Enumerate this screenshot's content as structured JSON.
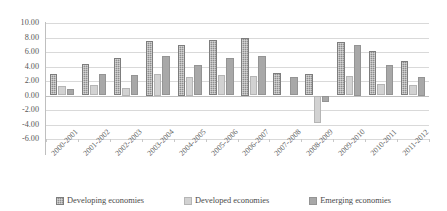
{
  "chart_data": {
    "type": "bar",
    "title": "",
    "subtitle": "",
    "xlabel": "",
    "ylabel": "",
    "ylim": [
      -6.0,
      10.0
    ],
    "ytick_step": 2.0,
    "yticks": [
      "10.00",
      "8.00",
      "6.00",
      "4.00",
      "2.00",
      "0.00",
      "-2.00",
      "-4.00",
      "-6.00"
    ],
    "ytick_values": [
      10.0,
      8.0,
      6.0,
      4.0,
      2.0,
      0.0,
      -2.0,
      -4.0,
      -6.0
    ],
    "grid": true,
    "legend_position": "bottom",
    "categories": [
      "2000-2001",
      "2001-2002",
      "2002-2003",
      "2003-2004",
      "2004-2005",
      "2005-2006",
      "2006-2007",
      "2007-2008",
      "2008-2009",
      "2009-2010",
      "2010-2011",
      "2011-2012"
    ],
    "series": [
      {
        "name": "Developing economies",
        "color": "#8f8f8f",
        "values": [
          2.9,
          4.4,
          5.2,
          7.5,
          7.0,
          7.7,
          8.0,
          3.1,
          2.9,
          7.4,
          6.2,
          4.7
        ]
      },
      {
        "name": "Developed economies",
        "color": "#d2d2d2",
        "values": [
          1.3,
          1.4,
          1.0,
          3.0,
          2.5,
          2.8,
          2.7,
          0.0,
          -3.8,
          2.7,
          1.6,
          1.4
        ]
      },
      {
        "name": "Emerging economies",
        "color": "#a8a8a8",
        "values": [
          0.9,
          2.9,
          2.8,
          5.4,
          4.2,
          5.2,
          5.4,
          2.6,
          -0.9,
          7.0,
          4.2,
          2.5
        ]
      }
    ]
  },
  "legend": {
    "items": [
      {
        "label": "Developing economies",
        "swatch_name": "legend-swatch-developing"
      },
      {
        "label": "Developed economies",
        "swatch_name": "legend-swatch-developed"
      },
      {
        "label": "Emerging economies",
        "swatch_name": "legend-swatch-emerging"
      }
    ]
  }
}
